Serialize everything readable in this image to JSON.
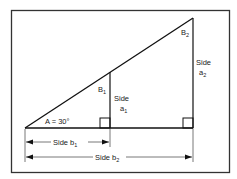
{
  "diagram": {
    "frame_color": "#333333",
    "line_color": "#111111",
    "labels": {
      "angle_a": "A = 30°",
      "angle_b1_main": "B",
      "angle_b1_sub": "1",
      "angle_b2_main": "B",
      "angle_b2_sub": "2",
      "side_a1_top": "Side",
      "side_a1_main": "a",
      "side_a1_sub": "1",
      "side_a2_top": "Side",
      "side_a2_main": "a",
      "side_a2_sub": "2",
      "side_b1_main": "Side b",
      "side_b1_sub": "1",
      "side_b2_main": "Side b",
      "side_b2_sub": "2"
    }
  }
}
